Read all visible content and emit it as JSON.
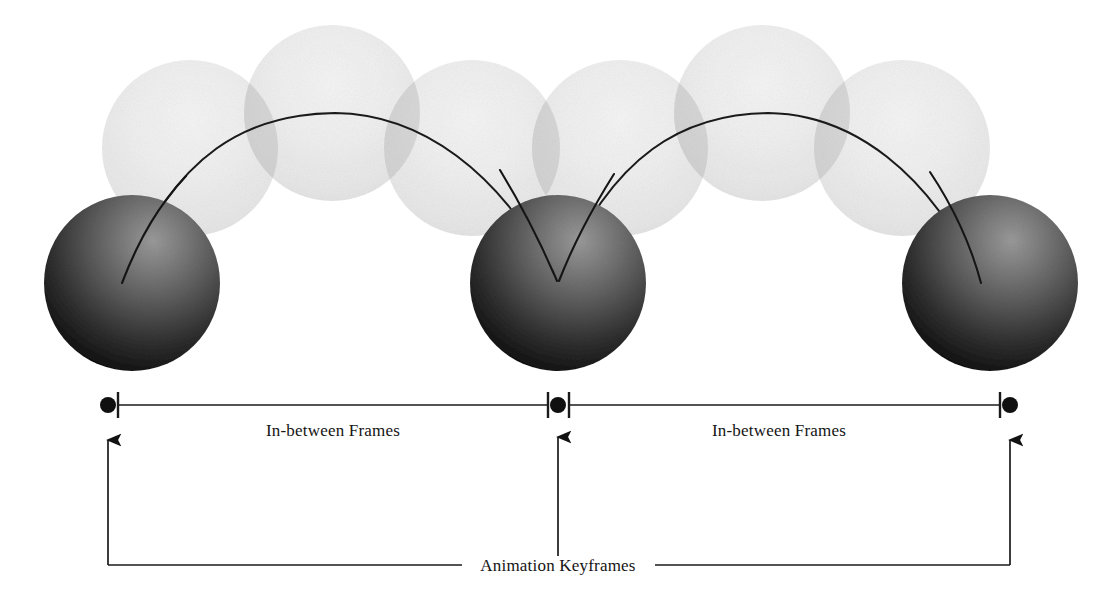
{
  "diagram": {
    "title": "Animation Keyframes",
    "type": "bouncing-ball-keyframe-timeline",
    "background_color": "#ffffff",
    "line_color": "#1a1a1a",
    "labels": {
      "inbetween_left": "In-between Frames",
      "inbetween_right": "In-between Frames",
      "keyframes": "Animation Keyframes"
    },
    "keyframe_balls": [
      {
        "name": "keyframe-ball-1",
        "cx": 132,
        "cy": 283,
        "r": 88,
        "shade": "dark"
      },
      {
        "name": "keyframe-ball-2",
        "cx": 558,
        "cy": 283,
        "r": 88,
        "shade": "dark"
      },
      {
        "name": "keyframe-ball-3",
        "cx": 990,
        "cy": 283,
        "r": 88,
        "shade": "dark"
      }
    ],
    "inbetween_balls": [
      {
        "name": "inbetween-ball-1",
        "cx": 190,
        "cy": 148,
        "r": 88,
        "shade": "light"
      },
      {
        "name": "inbetween-ball-2",
        "cx": 332,
        "cy": 113,
        "r": 88,
        "shade": "light"
      },
      {
        "name": "inbetween-ball-3",
        "cx": 472,
        "cy": 148,
        "r": 88,
        "shade": "light"
      },
      {
        "name": "inbetween-ball-4",
        "cx": 620,
        "cy": 148,
        "r": 88,
        "shade": "light"
      },
      {
        "name": "inbetween-ball-5",
        "cx": 762,
        "cy": 113,
        "r": 88,
        "shade": "light"
      },
      {
        "name": "inbetween-ball-6",
        "cx": 902,
        "cy": 148,
        "r": 88,
        "shade": "light"
      }
    ],
    "trajectory": {
      "arc_left": {
        "start_x": 122,
        "start_y": 283,
        "peak_x": 335,
        "peak_y": 113,
        "end_x": 557,
        "end_y": 281
      },
      "arc_right": {
        "start_x": 559,
        "start_y": 281,
        "peak_x": 768,
        "peak_y": 113,
        "end_x": 981,
        "end_y": 283
      }
    },
    "timeline": {
      "axis_y": 405,
      "markers": [
        {
          "name": "keyframe-marker-1",
          "x": 108,
          "tick_side": "right"
        },
        {
          "name": "keyframe-marker-2",
          "x": 558,
          "tick_side": "both"
        },
        {
          "name": "keyframe-marker-3",
          "x": 1010,
          "tick_side": "left"
        }
      ],
      "segments": [
        {
          "name": "inbetween-span-left",
          "from_x": 118,
          "to_x": 548
        },
        {
          "name": "inbetween-span-right",
          "from_x": 568,
          "to_x": 1000
        }
      ]
    },
    "bracket": {
      "left_x": 108,
      "right_x": 1010,
      "baseline_y": 565,
      "top_y": 440,
      "center_x": 558,
      "callout_arrow_tip_y": 437
    },
    "colors": {
      "ball_dark_highlight": "#8e8e8e",
      "ball_dark_core": "#3a3a3a",
      "ball_dark_shadow": "#111111",
      "ball_light_highlight": "#f2f2f2",
      "ball_light_core": "#e6e6e6",
      "ball_light_shadow": "#d6d6d6",
      "stroke": "#1a1a1a"
    }
  }
}
